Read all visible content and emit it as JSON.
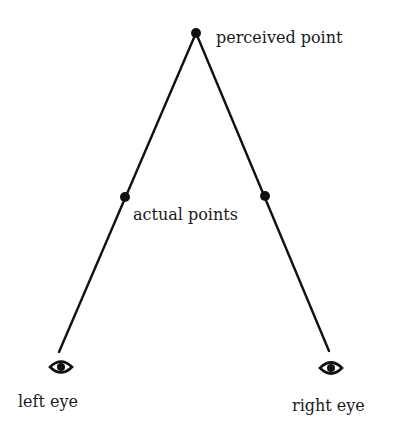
{
  "diagram": {
    "type": "binocular-vision-geometry",
    "labels": {
      "perceived_point": "perceived point",
      "actual_points": "actual points",
      "left_eye": "left eye",
      "right_eye": "right eye"
    },
    "points": {
      "perceived": {
        "x": 196,
        "y": 33
      },
      "actual_left": {
        "x": 125,
        "y": 197
      },
      "actual_right": {
        "x": 265,
        "y": 196
      }
    },
    "eyes": {
      "left": {
        "x": 61,
        "y": 367
      },
      "right": {
        "x": 331,
        "y": 368
      }
    },
    "lines": [
      {
        "from": "perceived",
        "to": "left_eye",
        "x1": 196,
        "y1": 33,
        "x2": 59,
        "y2": 352
      },
      {
        "from": "perceived",
        "to": "right_eye",
        "x1": 196,
        "y1": 33,
        "x2": 329,
        "y2": 351
      }
    ],
    "colors": {
      "stroke": "#111111",
      "background": "#ffffff"
    }
  }
}
